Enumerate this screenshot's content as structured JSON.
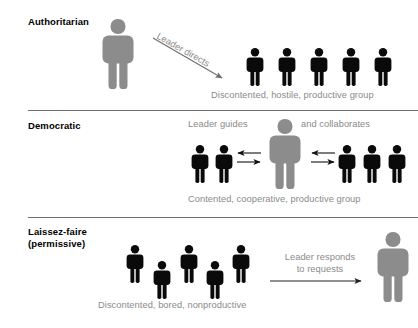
{
  "diagram": {
    "colors": {
      "leader": "#8c8c8c",
      "member": "#0a0a0a",
      "caption_text": "#8a8a8a",
      "label_text": "#000000",
      "divider": "#6d6d6d",
      "background": "#ffffff"
    },
    "sections": [
      {
        "id": "authoritarian",
        "label": "Authoritarian",
        "label_line2": "",
        "annotation": "Leader directs",
        "caption": "Discontented, hostile, productive group",
        "leader_icon": "person-figure-leader-icon",
        "member_icon": "person-figure-member-icon",
        "member_count": 5,
        "arrow_direction": "down-right"
      },
      {
        "id": "democratic",
        "label": "Democratic",
        "label_line2": "",
        "annotation_left": "Leader guides",
        "annotation_right": "and collaborates",
        "caption": "Contented, cooperative, productive group",
        "leader_icon": "person-figure-leader-icon",
        "member_icon": "person-figure-member-icon",
        "member_count_left": 2,
        "member_count_right": 3,
        "arrow_direction": "bidirectional"
      },
      {
        "id": "laissez-faire",
        "label": "Laissez-faire",
        "label_line2": "(permissive)",
        "annotation_line1": "Leader responds",
        "annotation_line2": "to requests",
        "caption": "Discontented, bored, nonproductive",
        "leader_icon": "person-figure-leader-icon",
        "member_icon": "person-figure-member-icon",
        "member_count": 5,
        "arrow_direction": "right"
      }
    ]
  }
}
